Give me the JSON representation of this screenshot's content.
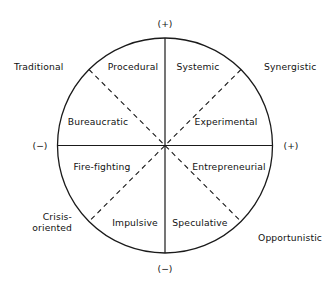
{
  "figure": {
    "geometry": {
      "center_x": 165,
      "center_y": 145.5,
      "radius": 107.5
    },
    "colors": {
      "stroke": "#1a1a1a",
      "background": "#ffffff",
      "text": "#111111"
    }
  },
  "axes": {
    "top_label": "(+)",
    "bottom_label": "(−)",
    "left_label": "(−)",
    "right_label": "(+)"
  },
  "inner_sectors": [
    {
      "key": "procedural",
      "label": "Procedural",
      "x": 133,
      "y": 66
    },
    {
      "key": "systemic",
      "label": "Systemic",
      "x": 198,
      "y": 66
    },
    {
      "key": "bureaucratic",
      "label": "Bureaucratic",
      "x": 98,
      "y": 121
    },
    {
      "key": "experimental",
      "label": "Experimental",
      "x": 226,
      "y": 121
    },
    {
      "key": "fire-fighting",
      "label": "Fire-fighting",
      "x": 102,
      "y": 166
    },
    {
      "key": "entrepreneurial",
      "label": "Entrepreneurial",
      "x": 229,
      "y": 166
    },
    {
      "key": "impulsive",
      "label": "Impulsive",
      "x": 135,
      "y": 222
    },
    {
      "key": "speculative",
      "label": "Speculative",
      "x": 200,
      "y": 222
    }
  ],
  "outer_labels": [
    {
      "key": "traditional",
      "label": "Traditional",
      "x": 14,
      "y": 66,
      "align": "left"
    },
    {
      "key": "synergistic",
      "label": "Synergistic",
      "x": 264,
      "y": 66,
      "align": "left"
    },
    {
      "key": "crisis-oriented",
      "label": "Crisis-\noriented",
      "x": 72,
      "y": 228,
      "align": "right"
    },
    {
      "key": "opportunistic",
      "label": "Opportunistic",
      "x": 258,
      "y": 237,
      "align": "left"
    }
  ],
  "crisis_oriented": {
    "line1": "Crisis-",
    "line2": "oriented"
  }
}
